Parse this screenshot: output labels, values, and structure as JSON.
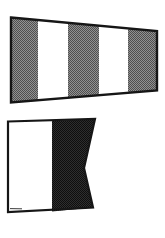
{
  "canvas": {
    "width": 165,
    "height": 238,
    "background": "#ffffff"
  },
  "colors": {
    "outline": "#161616",
    "white": "#ffffff",
    "pennant_halftone_dark": "#4f4f4f",
    "pennant_halftone_light": "#929292",
    "alfa_halftone_dark": "#0e0e0e",
    "alfa_halftone_light": "#2e2e2e",
    "artifact_line": "#3c3c3c"
  },
  "flags": {
    "pennant": {
      "name": "answering-pennant",
      "label": "Code / Answering pennant",
      "stripe_count": 5,
      "stripe_order": [
        "shaded",
        "white",
        "shaded",
        "white",
        "shaded"
      ]
    },
    "alfa": {
      "name": "alfa-flag",
      "label": "Alfa (A) signal flag",
      "halves": [
        "white hoist half",
        "dark swallow-tailed fly half"
      ]
    }
  }
}
